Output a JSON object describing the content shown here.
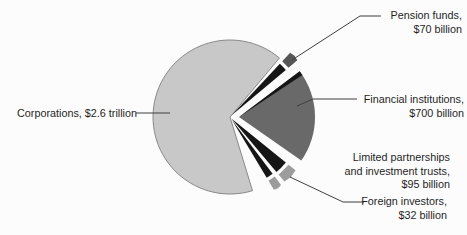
{
  "chart_data": {
    "type": "pie",
    "title": "",
    "legend_position": "none",
    "slices": [
      {
        "id": "pension-funds",
        "label": "Pension funds",
        "value_billions": 70,
        "display": "Pension funds,\n$70 billion"
      },
      {
        "id": "financial-institutions",
        "label": "Financial institutions",
        "value_billions": 700,
        "display": "Financial institutions,\n$700 billion"
      },
      {
        "id": "limited-partnerships",
        "label": "Limited partnerships and investment trusts",
        "value_billions": 95,
        "display": "Limited partnerships\nand investment trusts,\n$95 billion"
      },
      {
        "id": "foreign-investors",
        "label": "Foreign investors",
        "value_billions": 32,
        "display": "Foreign investors,\n$32 billion"
      },
      {
        "id": "corporations",
        "label": "Corporations",
        "value_billions": 2600,
        "display": "Corporations, $2.6 trillion"
      }
    ],
    "colors": {
      "main_fill": "#c8c8c8",
      "main_stroke": "#898989",
      "wedge_fill": "#696969",
      "sliver_fill": "#161616",
      "cap_fill": "#9c9c9c",
      "leader": "#3f3f3f",
      "text": "#1f1f1f"
    },
    "render": {
      "center": [
        230,
        117
      ],
      "slices": {
        "corporations": {
          "kind": "main",
          "start_deg": -73,
          "end_deg": -310,
          "r": 77
        },
        "financial-institutions": {
          "kind": "wedge",
          "start_deg": 37,
          "end_deg": -35,
          "r": 76,
          "offset": [
            9,
            0
          ],
          "dark_edge": [
            37,
            33.5
          ]
        },
        "pension-funds": {
          "kind": "sliver",
          "start_deg": 47,
          "end_deg": 40,
          "body_r": 71,
          "cap_r": [
            74.5,
            86
          ],
          "apex_offset": 2,
          "cap_fill": "#565656"
        },
        "limited-partnerships": {
          "kind": "sliver",
          "start_deg": -39,
          "end_deg": -50,
          "body_r": 70,
          "cap_r": [
            73.5,
            82.5
          ],
          "apex_offset": 2
        },
        "foreign-investors": {
          "kind": "sliver",
          "start_deg": -53,
          "end_deg": -59,
          "body_r": 68,
          "cap_r": [
            71.5,
            82
          ],
          "apex_offset": 3
        }
      },
      "leaders": {
        "pension-funds": [
          [
            292,
            60
          ],
          [
            360,
            16
          ],
          [
            381,
            16
          ]
        ],
        "financial-institutions": [
          [
            297,
            106
          ],
          [
            313,
            99
          ],
          [
            357,
            99
          ]
        ],
        "foreign-investors": [
          [
            290,
            177
          ],
          [
            343,
            202
          ],
          [
            364,
            202
          ]
        ],
        "corporations": [
          [
            170,
            113
          ],
          [
            136,
            113
          ]
        ]
      }
    }
  }
}
